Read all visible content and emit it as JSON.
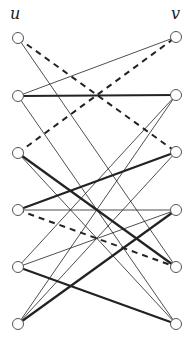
{
  "labels": {
    "u": "u",
    "v": "v"
  },
  "nodes": {
    "u": [
      [
        18,
        38
      ],
      [
        18,
        96
      ],
      [
        18,
        153
      ],
      [
        18,
        210
      ],
      [
        18,
        267
      ],
      [
        18,
        324
      ]
    ],
    "v": [
      [
        176,
        37
      ],
      [
        176,
        95
      ],
      [
        176,
        152
      ],
      [
        176,
        210
      ],
      [
        176,
        267
      ],
      [
        176,
        324
      ]
    ]
  },
  "edges": [
    {
      "u": 0,
      "v": 2,
      "style": "dashed"
    },
    {
      "u": 0,
      "v": 4,
      "style": "thin"
    },
    {
      "u": 1,
      "v": 0,
      "style": "thin"
    },
    {
      "u": 1,
      "v": 1,
      "style": "thick"
    },
    {
      "u": 1,
      "v": 5,
      "style": "thin"
    },
    {
      "u": 2,
      "v": 0,
      "style": "dashed"
    },
    {
      "u": 2,
      "v": 4,
      "style": "thick"
    },
    {
      "u": 2,
      "v": 5,
      "style": "thin"
    },
    {
      "u": 3,
      "v": 2,
      "style": "thick"
    },
    {
      "u": 3,
      "v": 4,
      "style": "dashed"
    },
    {
      "u": 3,
      "v": 3,
      "style": "thin"
    },
    {
      "u": 4,
      "v": 3,
      "style": "thin"
    },
    {
      "u": 4,
      "v": 5,
      "style": "thick"
    },
    {
      "u": 4,
      "v": 1,
      "style": "thin"
    },
    {
      "u": 5,
      "v": 1,
      "style": "thin"
    },
    {
      "u": 5,
      "v": 2,
      "style": "thin"
    },
    {
      "u": 5,
      "v": 3,
      "style": "thick"
    }
  ]
}
